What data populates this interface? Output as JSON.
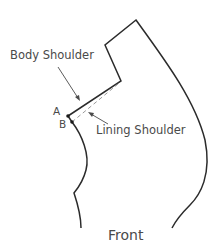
{
  "diagram": {
    "title": "Front",
    "labels": {
      "body_shoulder": "Body Shoulder",
      "lining_shoulder": "Lining Shoulder",
      "point_a": "A",
      "point_b": "B"
    },
    "colors": {
      "outline": "#2b2b2b",
      "dashed": "#9a9a9a",
      "text": "#4a4a4a",
      "background": "#ffffff"
    }
  }
}
